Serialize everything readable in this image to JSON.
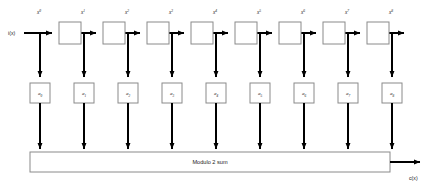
{
  "diagram": {
    "input_label": "i(x)",
    "output_label": "c(x)",
    "sum_block_label": "Modulo 2 sum",
    "stage_count": 9,
    "delay_labels": [
      "x",
      "x",
      "x",
      "x",
      "x",
      "x",
      "x",
      "x",
      "x"
    ],
    "delay_exponents": [
      "0",
      "1",
      "2",
      "3",
      "4",
      "5",
      "6",
      "7",
      "8"
    ],
    "tap_base": "a",
    "tap_subscripts": [
      "0",
      "1",
      "2",
      "3",
      "4",
      "5",
      "6",
      "7",
      "8"
    ],
    "colors": {
      "background": "#ffffff",
      "wire": "#000000",
      "box_stroke": "#8a8a8a",
      "box_fill": "#ffffff",
      "text": "#1a1a1a"
    }
  }
}
